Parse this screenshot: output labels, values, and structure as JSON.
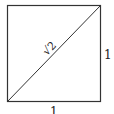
{
  "diagram": {
    "title": "",
    "shape": "square",
    "diagonal_label": "√2",
    "right_side_label": "1",
    "bottom_side_label": "1",
    "colors": {
      "stroke": "#333333",
      "background": "#ffffff"
    }
  }
}
